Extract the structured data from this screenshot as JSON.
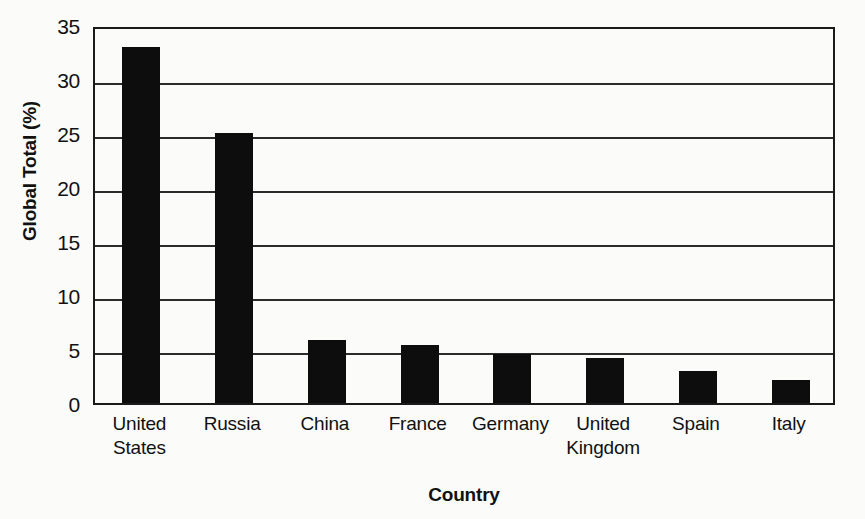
{
  "chart_data": {
    "type": "bar",
    "title": "",
    "subtitle": "",
    "xlabel": "Country",
    "ylabel": "Global Total (%)",
    "categories": [
      "United States",
      "Russia",
      "China",
      "France",
      "Germany",
      "United Kingdom",
      "Spain",
      "Italy"
    ],
    "category_lines": [
      [
        "United",
        "States"
      ],
      [
        "Russia"
      ],
      [
        "China"
      ],
      [
        "France"
      ],
      [
        "Germany"
      ],
      [
        "United",
        "Kingdom"
      ],
      [
        "Spain"
      ],
      [
        "Italy"
      ]
    ],
    "values": [
      33.0,
      25.0,
      5.8,
      5.4,
      4.5,
      4.2,
      3.0,
      2.1
    ],
    "ylim": [
      0,
      35
    ],
    "ytick_values": [
      0,
      5,
      10,
      15,
      20,
      25,
      30,
      35
    ],
    "ytick_labels": [
      "0",
      "5",
      "10",
      "15",
      "20",
      "25",
      "30",
      "35"
    ],
    "grid": true,
    "grid_axis": "y",
    "legend": false,
    "legend_position": "none",
    "bar_color": "#0d0d0d",
    "background_color": "#fbfbf9",
    "axis_color": "#1a1a1a",
    "orientation": "vertical"
  }
}
